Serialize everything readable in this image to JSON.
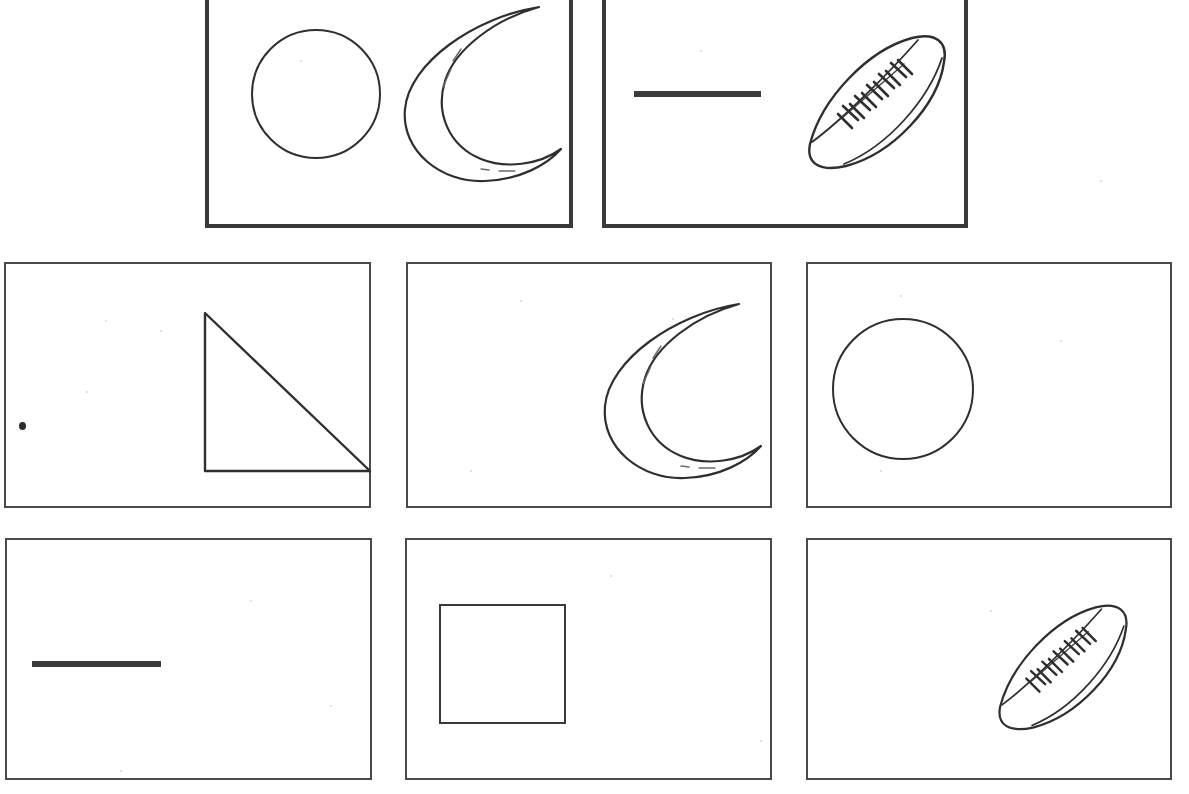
{
  "worksheet": {
    "title": "Shape Matching Worksheet",
    "description": "Line-art worksheet: two bordered sample panels on the top row and six bordered answer panels arranged in two rows of three.",
    "canvas": {
      "width": 1189,
      "height": 794
    },
    "ink_color": "#3a3a3a",
    "thin_border_color": "#4a4a4a",
    "background_color": "#ffffff"
  },
  "rows": [
    {
      "name": "sample-row",
      "border_weight": "thick",
      "panels": [
        {
          "id": "panel-sample-1",
          "label": "Sample panel 1",
          "x": 205,
          "y": -6,
          "w": 368,
          "h": 234,
          "shapes": [
            {
              "name": "circle-shape",
              "type": "circle",
              "cx": 107,
              "cy": 100,
              "r": 64
            },
            {
              "name": "crescent-moon-shape",
              "type": "crescent",
              "x": 180,
              "y": 5,
              "w": 175,
              "h": 190
            }
          ]
        },
        {
          "id": "panel-sample-2",
          "label": "Sample panel 2",
          "x": 602,
          "y": -6,
          "w": 366,
          "h": 234,
          "shapes": [
            {
              "name": "horizontal-line-shape",
              "type": "line",
              "x": 28,
              "y": 97,
              "w": 127,
              "h": 6
            },
            {
              "name": "football-shape",
              "type": "football",
              "x": 190,
              "y": 30,
              "w": 160,
              "h": 150
            }
          ]
        }
      ]
    },
    {
      "name": "answer-row-1",
      "border_weight": "thin",
      "panels": [
        {
          "id": "panel-a1",
          "label": "Answer panel 1",
          "x": 4,
          "y": 262,
          "w": 367,
          "h": 246,
          "shapes": [
            {
              "name": "right-triangle-shape",
              "type": "triangle",
              "x": 196,
              "y": 46,
              "w": 165,
              "h": 158
            }
          ],
          "artifacts": [
            {
              "name": "paper-speck",
              "x": 13,
              "y": 158
            }
          ]
        },
        {
          "id": "panel-a2",
          "label": "Answer panel 2",
          "x": 406,
          "y": 262,
          "w": 366,
          "h": 246,
          "shapes": [
            {
              "name": "crescent-moon-shape",
              "type": "crescent",
              "x": 181,
              "y": 32,
              "w": 175,
              "h": 190
            }
          ]
        },
        {
          "id": "panel-a3",
          "label": "Answer panel 3",
          "x": 806,
          "y": 262,
          "w": 366,
          "h": 246,
          "shapes": [
            {
              "name": "circle-shape",
              "type": "circle",
              "cx": 95,
              "cy": 125,
              "r": 70
            }
          ]
        }
      ]
    },
    {
      "name": "answer-row-2",
      "border_weight": "thin",
      "panels": [
        {
          "id": "panel-b1",
          "label": "Answer panel 4",
          "x": 5,
          "y": 538,
          "w": 367,
          "h": 242,
          "shapes": [
            {
              "name": "horizontal-line-shape",
              "type": "line",
              "x": 25,
              "y": 121,
              "w": 129,
              "h": 6
            }
          ]
        },
        {
          "id": "panel-b2",
          "label": "Answer panel 5",
          "x": 405,
          "y": 538,
          "w": 367,
          "h": 242,
          "shapes": [
            {
              "name": "square-shape",
              "type": "square",
              "x": 32,
              "y": 64,
              "w": 127,
              "h": 120
            }
          ]
        },
        {
          "id": "panel-b3",
          "label": "Answer panel 6",
          "x": 806,
          "y": 538,
          "w": 366,
          "h": 242,
          "shapes": [
            {
              "name": "football-shape",
              "type": "football",
              "x": 179,
              "y": 54,
              "w": 150,
              "h": 141
            }
          ]
        }
      ]
    }
  ],
  "flecks": [
    {
      "x": 105,
      "y": 320
    },
    {
      "x": 160,
      "y": 330
    },
    {
      "x": 86,
      "y": 391
    },
    {
      "x": 520,
      "y": 300
    },
    {
      "x": 672,
      "y": 318
    },
    {
      "x": 900,
      "y": 295
    },
    {
      "x": 1060,
      "y": 340
    },
    {
      "x": 250,
      "y": 600
    },
    {
      "x": 610,
      "y": 575
    },
    {
      "x": 990,
      "y": 610
    },
    {
      "x": 330,
      "y": 705
    },
    {
      "x": 760,
      "y": 740
    },
    {
      "x": 120,
      "y": 770
    },
    {
      "x": 470,
      "y": 470
    },
    {
      "x": 880,
      "y": 470
    },
    {
      "x": 1100,
      "y": 180
    },
    {
      "x": 300,
      "y": 60
    },
    {
      "x": 700,
      "y": 50
    }
  ]
}
